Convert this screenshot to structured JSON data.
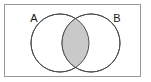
{
  "figure": {
    "type": "venn-diagram",
    "title": "",
    "background_color": "#ffffff"
  },
  "frame": {
    "name": "universal-set-rectangle",
    "x": 4,
    "y": 4,
    "width": 137,
    "height": 73,
    "stroke_color": "#999999",
    "stroke_width": 1,
    "fill_color": "#ffffff"
  },
  "sets": [
    {
      "id": "A",
      "label": "A",
      "label_x": 34,
      "label_y": 22,
      "circle": {
        "cx": 60,
        "cy": 43,
        "r": 29,
        "stroke_color": "#4d4d4d",
        "stroke_width": 1,
        "fill_color": "#ffffff"
      }
    },
    {
      "id": "B",
      "label": "B",
      "label_x": 117,
      "label_y": 22,
      "circle": {
        "cx": 91,
        "cy": 43,
        "r": 29,
        "stroke_color": "#4d4d4d",
        "stroke_width": 1,
        "fill_color": "#ffffff"
      }
    }
  ],
  "intersection": {
    "name": "a-intersect-b-region",
    "label": "",
    "shaded": true,
    "fill_color": "#c9c9c9",
    "stroke_color": "#4d4d4d",
    "top_vertex": {
      "x": 75.5,
      "y": 16.6
    },
    "bottom_vertex": {
      "x": 75.5,
      "y": 69.4
    }
  }
}
